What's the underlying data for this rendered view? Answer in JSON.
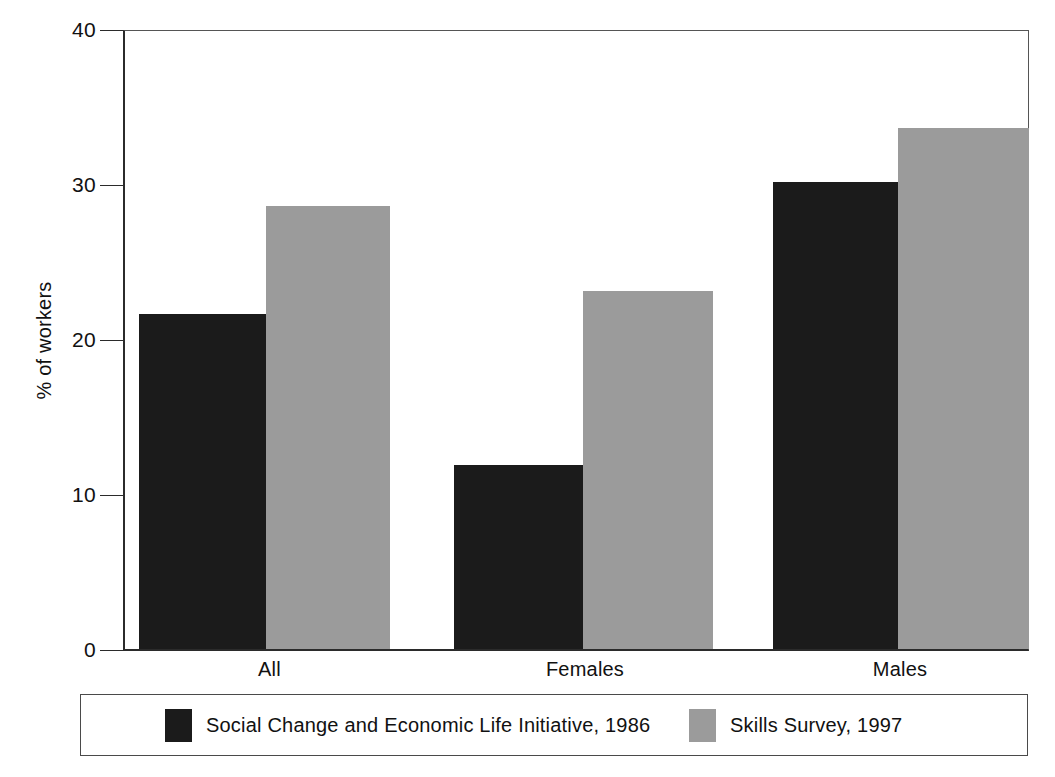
{
  "chart_data": {
    "type": "bar",
    "title": "",
    "xlabel": "",
    "ylabel": "% of workers",
    "categories": [
      "All",
      "Females",
      "Males"
    ],
    "series": [
      {
        "name": "Social Change and Economic Life Initiative, 1986",
        "color": "#1b1b1b",
        "values": [
          21.7,
          11.9,
          30.2
        ]
      },
      {
        "name": "Skills Survey, 1997",
        "color": "#9b9b9b",
        "values": [
          28.7,
          23.2,
          33.7
        ]
      }
    ],
    "ylim": [
      0,
      40
    ],
    "yticks": [
      0,
      10,
      20,
      30,
      40
    ],
    "ytick_labels": [
      "0",
      "10",
      "20",
      "30",
      "40"
    ],
    "grid": false,
    "legend_position": "bottom"
  },
  "axis": {
    "y_title": "% of workers",
    "y_ticks": [
      {
        "value": 40,
        "label": "40"
      },
      {
        "value": 30,
        "label": "30"
      },
      {
        "value": 20,
        "label": "20"
      },
      {
        "value": 10,
        "label": "10"
      },
      {
        "value": 0,
        "label": "0"
      }
    ],
    "x_categories": [
      "All",
      "Females",
      "Males"
    ]
  },
  "legend": {
    "entries": [
      {
        "label": "Social Change and Economic Life Initiative, 1986",
        "swatch": "dark"
      },
      {
        "label": "Skills Survey, 1997",
        "swatch": "light"
      }
    ]
  },
  "colors": {
    "dark": "#1b1b1b",
    "light": "#9b9b9b",
    "axis": "#2b2b2b",
    "frame": "#555555",
    "background": "#ffffff"
  }
}
